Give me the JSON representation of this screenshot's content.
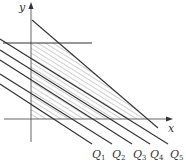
{
  "diagram": {
    "type": "linear-programming-feasible-region",
    "axes": {
      "x_label": "x",
      "y_label": "y"
    },
    "lines": {
      "horizontal_constraint": {
        "x1": 3,
        "y1": 43,
        "x2": 92,
        "y2": 43
      },
      "slanted_constraint": {
        "x1": 32,
        "y1": 20,
        "x2": 158,
        "y2": 128
      }
    },
    "level_lines": [
      {
        "label": "Q",
        "sub": "1",
        "x1": 0,
        "y1": 84,
        "x2": 92,
        "y2": 144,
        "lx": 94,
        "ly": 157
      },
      {
        "label": "Q",
        "sub": "2",
        "x1": 0,
        "y1": 74,
        "x2": 112,
        "y2": 144,
        "lx": 114,
        "ly": 157
      },
      {
        "label": "Q",
        "sub": "3",
        "x1": 0,
        "y1": 60,
        "x2": 132,
        "y2": 144,
        "lx": 134,
        "ly": 157
      },
      {
        "label": "Q",
        "sub": "4",
        "x1": 0,
        "y1": 50,
        "x2": 150,
        "y2": 144,
        "lx": 151,
        "ly": 157
      },
      {
        "label": "Q",
        "sub": "5",
        "x1": 0,
        "y1": 39,
        "x2": 168,
        "y2": 144,
        "lx": 170,
        "ly": 157
      }
    ],
    "colors": {
      "line": "#222222",
      "axis": "#555555",
      "hatch": "#666666"
    }
  }
}
